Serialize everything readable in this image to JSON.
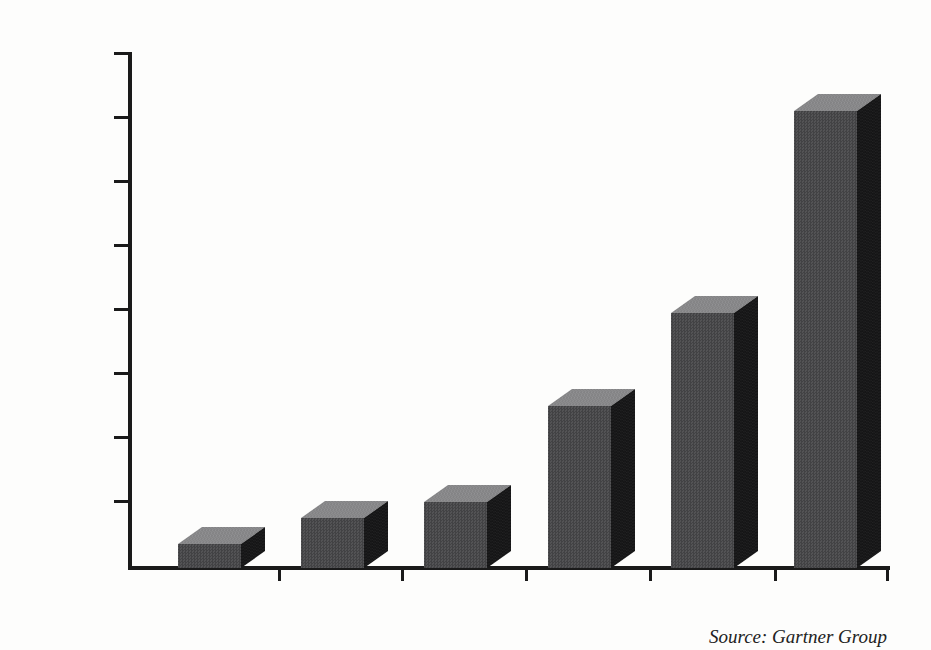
{
  "chart_data": {
    "type": "bar",
    "title": "",
    "xlabel": "",
    "ylabel": "",
    "categories": [
      "1999",
      "2000",
      "2001",
      "2002",
      "2003",
      "2004"
    ],
    "values": [
      350,
      750,
      1000,
      2500,
      3950,
      7100
    ],
    "ylim": [
      0,
      8000
    ],
    "ytick_interval": 1000,
    "ytick_labels": [
      "8000",
      "7000",
      "6000",
      "5000",
      "4000",
      "3000",
      "2000",
      "1000",
      "0"
    ],
    "grid": "off",
    "legend": "none",
    "style": "3d-block-bars",
    "source_note": "Source: Gartner Group",
    "colors": {
      "bar_front": "#535355",
      "bar_top": "#929294",
      "bar_side": "#151516",
      "axis": "#1a1a1a",
      "text": "#1b1b1b",
      "background": "#fdfdfc"
    }
  }
}
